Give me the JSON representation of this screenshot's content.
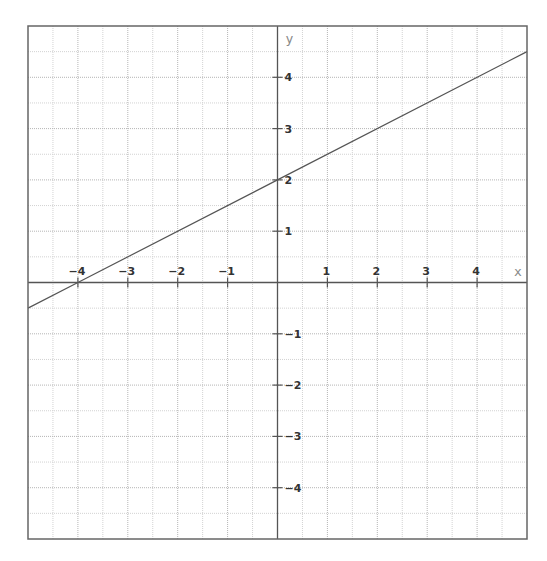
{
  "chart_data": {
    "type": "line",
    "title": "",
    "xlabel": "x",
    "ylabel": "y",
    "xlim": [
      -5,
      5
    ],
    "ylim": [
      -5,
      5
    ],
    "grid": true,
    "grid_step": 0.5,
    "x_ticks": [
      -4,
      -3,
      -2,
      -1,
      1,
      2,
      3,
      4
    ],
    "y_ticks": [
      -4,
      -3,
      -2,
      -1,
      1,
      2,
      3,
      4
    ],
    "x_tick_labels": [
      "−4",
      "−3",
      "−2",
      "−1",
      "1",
      "2",
      "3",
      "4"
    ],
    "y_tick_labels": [
      "−4",
      "−3",
      "−2",
      "−1",
      "1",
      "2",
      "3",
      "4"
    ],
    "series": [
      {
        "name": "y = 0.5x + 2",
        "slope": 0.5,
        "intercept": 2,
        "x": [
          -5,
          -4,
          0,
          5
        ],
        "y": [
          -0.5,
          0,
          2,
          4.5
        ]
      }
    ],
    "legend": null
  },
  "layout": {
    "frame": {
      "left": 28,
      "top": 26,
      "right": 527,
      "bottom": 539
    },
    "origin": {
      "x": 277,
      "y": 283
    }
  },
  "colors": {
    "background": "#ffffff",
    "frame": "#666666",
    "axis": "#555555",
    "grid_major": "#b5b5b5",
    "grid_minor": "#d2d2d2",
    "line": "#555555",
    "tick_label": "#333333",
    "axis_label": "#888888"
  }
}
